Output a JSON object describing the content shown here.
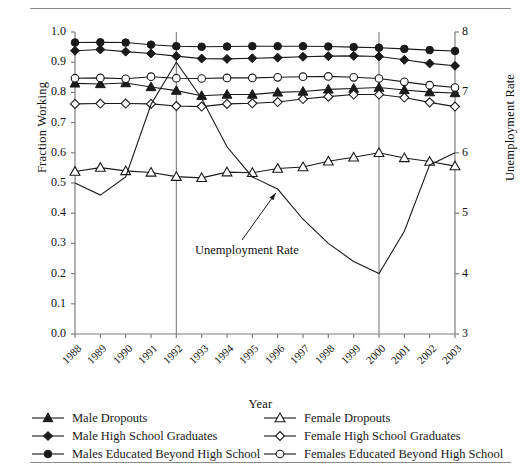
{
  "chart_data": {
    "type": "line",
    "title": "",
    "xlabel": "Year",
    "ylabel": "Fraction Working",
    "ylabel_right": "Unemployment Rate",
    "categories": [
      "1988",
      "1989",
      "1990",
      "1991",
      "1992",
      "1993",
      "1994",
      "1995",
      "1996",
      "1997",
      "1998",
      "1999",
      "2000",
      "2001",
      "2002",
      "2003"
    ],
    "ylim": [
      0.0,
      1.0
    ],
    "yticks": [
      "0.0",
      "0.1",
      "0.2",
      "0.3",
      "0.4",
      "0.5",
      "0.6",
      "0.7",
      "0.8",
      "0.9",
      "1.0"
    ],
    "ylim_right": [
      3,
      8
    ],
    "yticks_right": [
      "3",
      "4",
      "5",
      "6",
      "7",
      "8"
    ],
    "grid": false,
    "legend_position": "below",
    "reference_lines": [
      1992,
      2000
    ],
    "annotations": [
      {
        "text": "Unemployment Rate",
        "points_to_year": 1996
      }
    ],
    "series": [
      {
        "name": "Male Dropouts",
        "marker": "filled-triangle",
        "axis": "left",
        "values": [
          0.83,
          0.828,
          0.831,
          0.818,
          0.806,
          0.789,
          0.793,
          0.793,
          0.8,
          0.803,
          0.81,
          0.813,
          0.816,
          0.808,
          0.801,
          0.798
        ]
      },
      {
        "name": "Male High School Graduates",
        "marker": "filled-diamond",
        "axis": "left",
        "values": [
          0.938,
          0.942,
          0.935,
          0.929,
          0.92,
          0.912,
          0.911,
          0.913,
          0.915,
          0.918,
          0.92,
          0.921,
          0.919,
          0.908,
          0.896,
          0.888
        ]
      },
      {
        "name": "Males Educated Beyond High School",
        "marker": "filled-circle",
        "axis": "left",
        "values": [
          0.965,
          0.966,
          0.965,
          0.958,
          0.953,
          0.951,
          0.952,
          0.953,
          0.953,
          0.953,
          0.952,
          0.95,
          0.948,
          0.944,
          0.94,
          0.937
        ]
      },
      {
        "name": "Female Dropouts",
        "marker": "open-triangle",
        "axis": "left",
        "values": [
          0.538,
          0.551,
          0.54,
          0.535,
          0.521,
          0.517,
          0.536,
          0.534,
          0.548,
          0.553,
          0.572,
          0.585,
          0.6,
          0.583,
          0.571,
          0.556
        ]
      },
      {
        "name": "Female High School Graduates",
        "marker": "open-diamond",
        "axis": "left",
        "values": [
          0.762,
          0.763,
          0.763,
          0.762,
          0.755,
          0.753,
          0.762,
          0.764,
          0.768,
          0.778,
          0.786,
          0.793,
          0.793,
          0.783,
          0.767,
          0.753
        ]
      },
      {
        "name": "Females Educated Beyond High School",
        "marker": "open-circle",
        "axis": "left",
        "values": [
          0.847,
          0.848,
          0.845,
          0.852,
          0.847,
          0.846,
          0.848,
          0.848,
          0.85,
          0.852,
          0.853,
          0.85,
          0.846,
          0.835,
          0.824,
          0.816
        ]
      },
      {
        "name": "Unemployment Rate",
        "marker": "none",
        "axis": "right",
        "values": [
          5.5,
          5.3,
          5.6,
          6.8,
          7.5,
          6.9,
          6.1,
          5.6,
          5.4,
          4.9,
          4.5,
          4.2,
          4.0,
          4.7,
          5.8,
          6.0
        ]
      }
    ]
  },
  "legend": {
    "items": [
      {
        "label": "Male Dropouts",
        "marker": "filled-triangle"
      },
      {
        "label": "Female Dropouts",
        "marker": "open-triangle"
      },
      {
        "label": "Male High School Graduates",
        "marker": "filled-diamond"
      },
      {
        "label": "Female High School Graduates",
        "marker": "open-diamond"
      },
      {
        "label": "Males Educated Beyond High School",
        "marker": "filled-circle"
      },
      {
        "label": "Females Educated Beyond High School",
        "marker": "open-circle"
      }
    ]
  },
  "colors": {
    "line": "#1a1a1a",
    "axis": "#7d7d7d",
    "rule": "#8a8a8a",
    "text": "#111111"
  }
}
